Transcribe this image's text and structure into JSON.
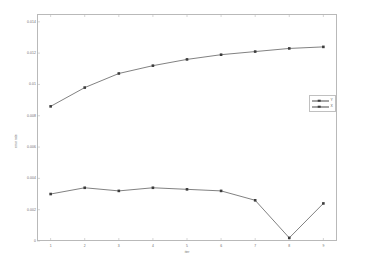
{
  "chart_data": {
    "type": "line",
    "title": "",
    "xlabel": "iter",
    "ylabel": "error rate",
    "x": [
      1,
      2,
      3,
      4,
      5,
      6,
      7,
      8,
      9
    ],
    "xlim": [
      0.6,
      9.4
    ],
    "ylim": [
      0,
      0.0145
    ],
    "grid": false,
    "legend_position": "upper right inside",
    "series": [
      {
        "name": "Y",
        "values": [
          0.0086,
          0.0098,
          0.0107,
          0.0112,
          0.0116,
          0.0119,
          0.0121,
          0.0123,
          0.0124
        ],
        "color": "#4a4a4a",
        "marker": "square"
      },
      {
        "name": "X",
        "values": [
          0.003,
          0.0034,
          0.0032,
          0.0034,
          0.0033,
          0.0032,
          0.0026,
          0.0002,
          0.0024
        ],
        "color": "#4a4a4a",
        "marker": "square"
      }
    ],
    "yticks": [
      {
        "value": 0.014,
        "label": "0.014"
      },
      {
        "value": 0.012,
        "label": "0.012"
      },
      {
        "value": 0.01,
        "label": "0.01"
      },
      {
        "value": 0.008,
        "label": "0.008"
      },
      {
        "value": 0.006,
        "label": "0.006"
      },
      {
        "value": 0.004,
        "label": "0.004"
      },
      {
        "value": 0.002,
        "label": "0.002"
      },
      {
        "value": 0.0,
        "label": "0"
      }
    ],
    "xticks": [
      {
        "value": 1,
        "label": "1"
      },
      {
        "value": 2,
        "label": "2"
      },
      {
        "value": 3,
        "label": "3"
      },
      {
        "value": 4,
        "label": "4"
      },
      {
        "value": 5,
        "label": "5"
      },
      {
        "value": 6,
        "label": "6"
      },
      {
        "value": 7,
        "label": "7"
      },
      {
        "value": 8,
        "label": "8"
      },
      {
        "value": 9,
        "label": "9"
      }
    ]
  }
}
